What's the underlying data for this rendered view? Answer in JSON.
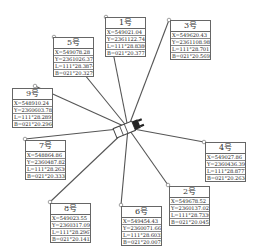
{
  "diagram": {
    "center": {
      "x": 128,
      "y": 128,
      "label": "device"
    },
    "line_color": "#555555",
    "points": [
      {
        "id": "1",
        "title": "1号",
        "box": {
          "x": 105,
          "y": 17
        },
        "anchor": {
          "x": 106,
          "y": 17
        },
        "rows": [
          "X=549021.04",
          "Y=2361122.74",
          "L=111°28.8380",
          "B=021°20.3771"
        ]
      },
      {
        "id": "3",
        "title": "3号",
        "box": {
          "x": 170,
          "y": 20
        },
        "anchor": {
          "x": 169,
          "y": 20
        },
        "rows": [
          "X=549620.43",
          "Y=2361108.98",
          "L=111°28.7011",
          "B=021°20.5692"
        ]
      },
      {
        "id": "5",
        "title": "5号",
        "box": {
          "x": 53,
          "y": 37
        },
        "anchor": {
          "x": 54,
          "y": 37
        },
        "rows": [
          "X=549078.28",
          "Y=2361026.37",
          "L=111°28.3874",
          "B=021°20.3279"
        ]
      },
      {
        "id": "9",
        "title": "9号",
        "box": {
          "x": 12,
          "y": 88
        },
        "anchor": {
          "x": 35,
          "y": 86
        },
        "rows": [
          "X=548910.24",
          "Y=2360603.78",
          "L=111°28.2895",
          "B=021°20.2966"
        ]
      },
      {
        "id": "7",
        "title": "7号",
        "box": {
          "x": 25,
          "y": 140
        },
        "anchor": {
          "x": 25,
          "y": 139
        },
        "rows": [
          "X=548864.86",
          "Y=2360487.82",
          "L=111°28.2630",
          "B=021°20.3338"
        ]
      },
      {
        "id": "4",
        "title": "4号",
        "box": {
          "x": 205,
          "y": 142
        },
        "anchor": {
          "x": 204,
          "y": 142
        },
        "rows": [
          "X=549027.86",
          "Y=2360436.39",
          "L=111°28.8777",
          "B=021°20.2634"
        ]
      },
      {
        "id": "2",
        "title": "2号",
        "box": {
          "x": 169,
          "y": 186
        },
        "anchor": {
          "x": 168,
          "y": 185
        },
        "rows": [
          "X=549678.52",
          "Y=2360137.02",
          "L=111°28.7330",
          "B=021°20.0452"
        ]
      },
      {
        "id": "6",
        "title": "6号",
        "box": {
          "x": 121,
          "y": 206
        },
        "anchor": {
          "x": 121,
          "y": 205
        },
        "rows": [
          "X=549454.43",
          "Y=2360071.66",
          "L=111°28.6035",
          "B=021°20.0075"
        ]
      },
      {
        "id": "8",
        "title": "8号",
        "box": {
          "x": 50,
          "y": 203
        },
        "anchor": {
          "x": 50,
          "y": 202
        },
        "rows": [
          "X=549023.55",
          "Y=2360317.09",
          "L=111°28.2967",
          "B=021°20.1412"
        ]
      }
    ]
  }
}
